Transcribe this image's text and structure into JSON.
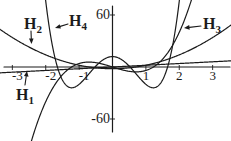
{
  "figure": {
    "background": "#ffffff",
    "ink_color": "#1b1b1b",
    "width": 231,
    "height": 141
  },
  "chart_data": {
    "type": "line",
    "title": "",
    "grid": false,
    "legend_position": "inline-arrow-annotations",
    "xlim": [
      -3.37,
      3.55
    ],
    "ylim": [
      -85.4,
      77.3
    ],
    "x_axis": {
      "ticks": [
        -3,
        -2,
        -1,
        1,
        2,
        3
      ],
      "tick_labels": [
        "-3",
        "-2",
        "-1",
        "1",
        "2",
        "3"
      ]
    },
    "y_axis": {
      "ticks": [
        60,
        -60
      ],
      "tick_labels": [
        "60",
        "-60"
      ]
    },
    "series": [
      {
        "name": "H1",
        "formula": "2x",
        "poly_coeffs": [
          0,
          2
        ]
      },
      {
        "name": "H2",
        "formula": "4x^2 - 2",
        "poly_coeffs": [
          -2,
          0,
          4
        ]
      },
      {
        "name": "H3",
        "formula": "8x^3 - 12x",
        "poly_coeffs": [
          0,
          -12,
          0,
          8
        ]
      },
      {
        "name": "H4",
        "formula": "16x^4 - 48x^2 + 12",
        "poly_coeffs": [
          12,
          0,
          -48,
          0,
          16
        ]
      }
    ],
    "annotations": [
      {
        "target": "H2",
        "main": "H",
        "sub": "2",
        "label_px": {
          "x": 24,
          "y": 29
        },
        "arrow": {
          "from": {
            "x": 31,
            "y": 31
          },
          "to": {
            "x": 31.5,
            "y": 44
          }
        }
      },
      {
        "target": "H4",
        "main": "H",
        "sub": "4",
        "label_px": {
          "x": 69,
          "y": 26
        },
        "arrow": {
          "from": {
            "x": 68,
            "y": 24
          },
          "to": {
            "x": 55,
            "y": 28
          }
        }
      },
      {
        "target": "H3",
        "main": "H",
        "sub": "3",
        "label_px": {
          "x": 203,
          "y": 29
        },
        "arrow": {
          "from": {
            "x": 201,
            "y": 26
          },
          "to": {
            "x": 184,
            "y": 28
          }
        }
      },
      {
        "target": "H1",
        "main": "H",
        "sub": "1",
        "label_px": {
          "x": 16,
          "y": 100
        },
        "arrow": {
          "from": {
            "x": 25,
            "y": 85
          },
          "to": {
            "x": 27,
            "y": 71
          }
        }
      }
    ]
  }
}
